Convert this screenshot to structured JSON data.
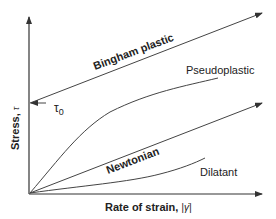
{
  "diagram": {
    "axes": {
      "y_label": "Stress,",
      "y_symbol": "τ",
      "x_label": "Rate of strain,",
      "x_symbol": "|γ̇|"
    },
    "yield_stress_label": "τ",
    "yield_stress_subscript": "0",
    "curves": [
      {
        "name": "Bingham plastic",
        "label": "Bingham plastic",
        "style": "bold",
        "shape": "straight line with intercept"
      },
      {
        "name": "Pseudoplastic",
        "label": "Pseudoplastic",
        "style": "normal",
        "shape": "concave down"
      },
      {
        "name": "Newtonian",
        "label": "Newtonian",
        "style": "bold",
        "shape": "straight line through origin"
      },
      {
        "name": "Dilatant",
        "label": "Dilatant",
        "style": "normal",
        "shape": "concave up"
      }
    ],
    "colors": {
      "line": "#444444",
      "text": "#222222",
      "background": "#ffffff"
    }
  }
}
